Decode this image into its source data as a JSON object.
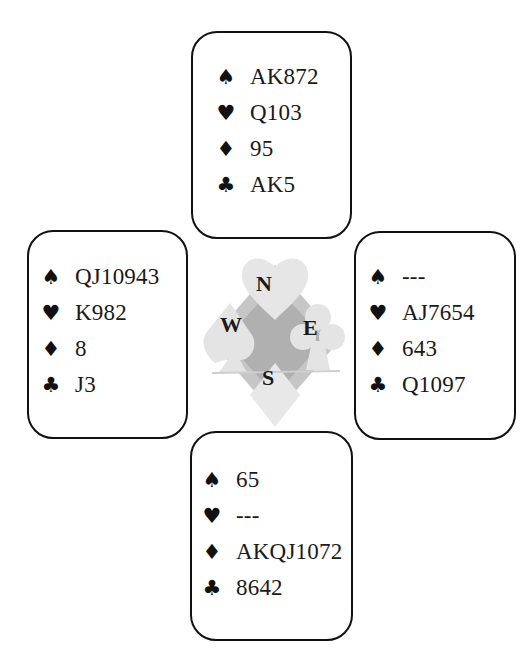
{
  "deal": {
    "north": {
      "spades": {
        "symbol": "♠",
        "cards": "AK872"
      },
      "hearts": {
        "symbol": "♥",
        "cards": "Q103"
      },
      "diamonds": {
        "symbol": "♦",
        "cards": "95"
      },
      "clubs": {
        "symbol": "♣",
        "cards": "AK5"
      }
    },
    "west": {
      "spades": {
        "symbol": "♠",
        "cards": "QJ10943"
      },
      "hearts": {
        "symbol": "♥",
        "cards": "K982"
      },
      "diamonds": {
        "symbol": "♦",
        "cards": "8"
      },
      "clubs": {
        "symbol": "♣",
        "cards": "J3"
      }
    },
    "east": {
      "spades": {
        "symbol": "♠",
        "cards": "---"
      },
      "hearts": {
        "symbol": "♥",
        "cards": "AJ7654"
      },
      "diamonds": {
        "symbol": "♦",
        "cards": "643"
      },
      "clubs": {
        "symbol": "♣",
        "cards": "Q1097"
      }
    },
    "south": {
      "spades": {
        "symbol": "♠",
        "cards": "65"
      },
      "hearts": {
        "symbol": "♥",
        "cards": "---"
      },
      "diamonds": {
        "symbol": "♦",
        "cards": "AKQJ1072"
      },
      "clubs": {
        "symbol": "♣",
        "cards": "8642"
      }
    }
  },
  "compass": {
    "north": "N",
    "west": "W",
    "east": "E",
    "south": "S",
    "colors": {
      "light": "#e2e2e2",
      "mid": "#bdbdbd",
      "dark": "#a6a6a6"
    }
  }
}
